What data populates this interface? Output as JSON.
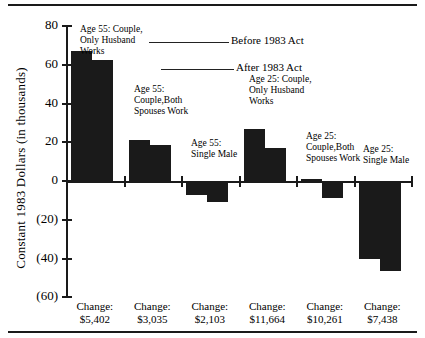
{
  "chart_data": {
    "type": "bar",
    "title": "",
    "xlabel": "",
    "ylabel": "Constant 1983 Dollars (in thousands)",
    "ylim": [
      -60,
      80
    ],
    "yticks": [
      80,
      60,
      40,
      20,
      0,
      -20,
      -40,
      -60
    ],
    "ytick_labels": [
      "80",
      "60",
      "40",
      "20",
      "0",
      "(20)",
      "(40)",
      "(60)"
    ],
    "grid": false,
    "legend_position": "inside-top-right",
    "categories": [
      "Age 55: Couple,\nOnly Husband\nWorks",
      "Age 55:\nCouple,Both\nSpouses Work",
      "Age 55:\nSingle Male",
      "Age 25: Couple,\nOnly Husband\nWorks",
      "Age 25:\nCouple,Both\nSpouses Work",
      "Age 25:\nSingle Male"
    ],
    "series": [
      {
        "name": "Before 1983 Act",
        "values": [
          67.0,
          21.0,
          -7.0,
          27.0,
          1.0,
          -40.0
        ]
      },
      {
        "name": "After 1983 Act",
        "values": [
          62.5,
          18.5,
          -11.0,
          17.0,
          -9.0,
          -46.5
        ]
      }
    ],
    "change_labels": [
      "Change:\n$5,402",
      "Change:\n$3,035",
      "Change:\n$2,103",
      "Change:\n$11,664",
      "Change:\n$10,261",
      "Change:\n$7,438"
    ]
  },
  "annotations": [
    {
      "text": "Age 55: Couple,\nOnly Husband\nWorks"
    },
    {
      "text": "Age 55:\nCouple,Both\nSpouses Work"
    },
    {
      "text": "Age 55:\nSingle Male"
    },
    {
      "text": "Age 25: Couple,\nOnly Husband\nWorks"
    },
    {
      "text": "Age 25:\nCouple,Both\nSpouses Work"
    },
    {
      "text": "Age 25:\nSingle Male"
    }
  ],
  "legend": {
    "before_label": "Before 1983 Act",
    "after_label": "After 1983 Act"
  },
  "colors": {
    "bar": "#1a1a1a",
    "axis": "#1a1a1a",
    "background": "#ffffff",
    "text": "#000000"
  }
}
